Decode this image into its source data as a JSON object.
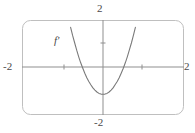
{
  "figure": {
    "title": "",
    "background_color": "#ffffff",
    "frame": {
      "color": "#b9b9b9",
      "corner_radius": 8,
      "x": 22,
      "y": 20,
      "width": 162,
      "height": 95
    }
  },
  "labels": {
    "top": "2",
    "bottom": "-2",
    "left": "-2",
    "right": "2",
    "curve": "f'"
  },
  "colors": {
    "axis": "#8a8a8a",
    "curve": "#7a7a7a",
    "frame": "#bcbcbc",
    "text": "#4a4a4a"
  },
  "chart_data": {
    "type": "line",
    "title": "",
    "xlabel": "",
    "ylabel": "",
    "xlim": [
      -2,
      2
    ],
    "ylim": [
      -2,
      2
    ],
    "grid": false,
    "legend": false,
    "xticks": [
      -2,
      -1,
      1,
      2
    ],
    "yticks": [
      -2,
      1,
      2
    ],
    "xtick_labels": [
      "-2",
      "",
      "",
      "2"
    ],
    "ytick_labels": [
      "-2",
      "",
      "2"
    ],
    "annotations": [
      {
        "text": "f'",
        "x": -1.18,
        "y": 1.0
      }
    ],
    "series": [
      {
        "name": "f'",
        "equation": "y = 4.4x^2 - 1.13",
        "roots": [
          -0.507,
          0.507
        ],
        "vertex": [
          0,
          -1.13
        ],
        "x": [
          -0.8,
          -0.75,
          -0.7,
          -0.65,
          -0.6,
          -0.55,
          -0.5,
          -0.45,
          -0.4,
          -0.35,
          -0.3,
          -0.25,
          -0.2,
          -0.15,
          -0.1,
          -0.05,
          0.0,
          0.05,
          0.1,
          0.15,
          0.2,
          0.25,
          0.3,
          0.35,
          0.4,
          0.45,
          0.5,
          0.55,
          0.6,
          0.65,
          0.7,
          0.75,
          0.8
        ],
        "y": [
          1.69,
          1.35,
          1.03,
          0.73,
          0.45,
          0.2,
          -0.03,
          -0.24,
          -0.43,
          -0.59,
          -0.73,
          -0.86,
          -0.95,
          -1.03,
          -1.09,
          -1.12,
          -1.13,
          -1.12,
          -1.09,
          -1.03,
          -0.95,
          -0.86,
          -0.73,
          -0.59,
          -0.43,
          -0.24,
          -0.03,
          0.2,
          0.45,
          0.73,
          1.03,
          1.35,
          1.69
        ]
      }
    ]
  }
}
